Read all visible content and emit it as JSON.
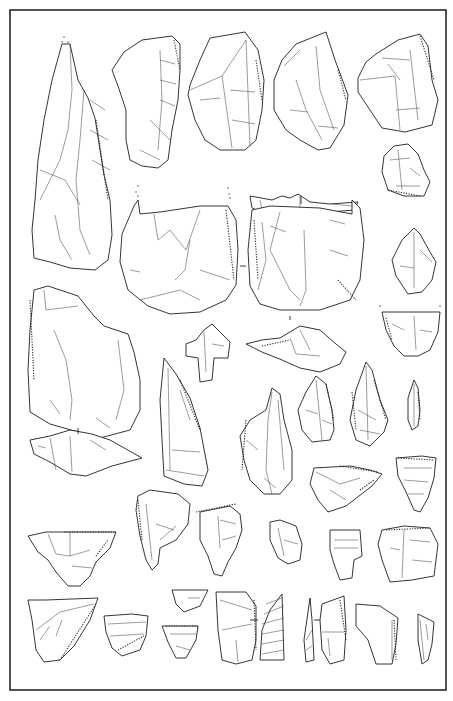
{
  "plate": {
    "width": 453,
    "height": 701,
    "background": "#ffffff",
    "line_color": "#1e1e1e",
    "frame": {
      "x": 10,
      "y": 10,
      "w": 436,
      "h": 680
    }
  },
  "artifacts": [
    {
      "id": "a1",
      "desc": "large pointed blade (tall, left column)",
      "path": "M62,44 L70,44 L78,80 L88,98 L95,118 L100,150 L104,175 L110,200 L112,235 L108,260 L95,270 L70,268 L50,262 L34,258 L32,230 L35,200 L38,160 L44,120 L52,80 Z",
      "scars": [
        "M70,44 L72,90 L68,130 L60,160 L40,200",
        "M84,90 L80,140 L76,180 L80,230 L90,255",
        "M40,170 L65,180 L80,205",
        "M55,215 L60,240 L72,260",
        "M90,100 L105,110",
        "M90,130 L108,140",
        "M92,160 L110,170"
      ],
      "retouch": [
        "M96,120 L102,160 L108,200"
      ]
    },
    {
      "id": "a2",
      "desc": "flake with cortex (top row, 2nd)",
      "path": "M124,52 L142,40 L172,36 L180,44 L180,70 L178,100 L172,130 L168,160 L158,168 L142,166 L130,160 L126,140 L126,110 L118,86 L112,70 Z",
      "scars": [
        "M160,50 L162,100 L158,150",
        "M160,60 L175,64",
        "M160,80 L176,84",
        "M160,100 L175,106",
        "M140,150 L160,160",
        "M150,120 L170,140"
      ],
      "retouch": [
        "M174,40 L180,70"
      ]
    },
    {
      "id": "a3",
      "desc": "trapezoidal flake (top row, 3rd)",
      "path": "M210,38 L245,32 L258,50 L264,80 L262,110 L256,140 L245,150 L220,150 L205,140 L195,120 L188,95 L190,85 L200,60 Z",
      "scars": [
        "M190,90 L222,76 L246,40",
        "M222,76 L232,148",
        "M246,40 L250,146",
        "M200,100 L220,98",
        "M230,90 L255,92",
        "M232,120 L255,124"
      ],
      "retouch": [
        "M256,60 L262,100"
      ]
    },
    {
      "id": "a4",
      "desc": "irregular flake (top row, 4th)",
      "path": "M296,44 L326,32 L335,60 L348,95 L344,125 L330,148 L318,150 L300,140 L286,130 L274,110 L274,80 L282,60 Z",
      "scars": [
        "M284,66 L300,50",
        "M296,80 L306,110 L322,140",
        "M316,46 L320,90 L334,130",
        "M290,110 L308,112",
        "M318,126 L338,128"
      ],
      "retouch": [
        "M338,70 L346,100"
      ]
    },
    {
      "id": "a5",
      "desc": "flake (top row, 5th)",
      "path": "M376,54 L398,40 L420,34 L428,46 L432,80 L438,100 L432,125 L405,132 L382,128 L370,110 L358,92 L358,78 L366,62 Z",
      "scars": [
        "M360,80 L395,76 L400,130",
        "M382,58 L410,60",
        "M410,50 L418,120",
        "M396,110 L420,108",
        "M388,64 L400,80"
      ],
      "retouch": [
        "M420,36 L434,80"
      ]
    },
    {
      "id": "a6",
      "desc": "small end-scraper (right column)",
      "path": "M394,146 L408,144 L418,154 L424,170 L430,182 L424,196 L404,196 L388,190 L382,172 L384,156 Z",
      "scars": [
        "M390,160 L410,158",
        "M398,150 L402,190",
        "M410,168 L420,176",
        "M396,186 L420,186"
      ],
      "retouch": [
        "M388,190 L420,196"
      ]
    },
    {
      "id": "a7",
      "desc": "longitudinal profile view (centre)",
      "path": "M250,196 L272,200 L282,196 L290,198 L298,194 L310,202 L330,204 L358,202 L354,210 L330,212 L300,214 L282,218 L266,214 L252,208 Z",
      "scars": [
        "M260,200 L262,210",
        "M300,196 L300,212",
        "M332,204 L352,206"
      ],
      "retouch": []
    },
    {
      "id": "a8",
      "desc": "large scraper, dorsal face",
      "path": "M134,206 L138,200 L140,214 L160,212 L200,206 L228,206 L236,220 L238,250 L236,285 L226,300 L200,312 L170,314 L148,306 L128,290 L120,262 L122,234 Z",
      "scars": [
        "M154,214 L158,240 L170,230 L186,250 L200,210",
        "M190,240 L185,270 L175,280",
        "M140,300 L180,290 L200,300",
        "M200,270 L230,280",
        "M130,270 L140,272"
      ],
      "retouch": [
        "M226,210 L234,280"
      ]
    },
    {
      "id": "a9",
      "desc": "large scraper, ventral face",
      "path": "M252,210 L270,206 L320,208 L352,214 L352,200 L360,208 L364,240 L360,280 L350,300 L320,310 L280,310 L260,304 L250,286 L248,250 Z",
      "scars": [
        "M262,222 L266,260 L258,290",
        "M280,212 L270,250 L290,290 L300,300",
        "M304,230 L306,290 L300,306",
        "M330,220 L345,224",
        "M330,250 L348,256",
        "M270,226 L286,232"
      ],
      "retouch": [
        "M254,220 L258,280",
        "M338,280 L356,300"
      ]
    },
    {
      "id": "a10",
      "desc": "pointed flake (right column)",
      "path": "M414,228 L420,234 L430,252 L436,262 L432,280 L422,292 L408,294 L396,276 L392,260 L402,240 Z",
      "scars": [
        "M414,232 L414,288",
        "M400,266 L414,268",
        "M420,250 L432,262"
      ],
      "retouch": []
    },
    {
      "id": "a11",
      "desc": "truncated flake fragment",
      "path": "M382,312 L440,312 L438,332 L430,350 L418,356 L404,356 L394,346 L386,330 Z",
      "scars": [
        "M414,316 L416,350",
        "M392,324 L404,330",
        "M420,330 L432,332"
      ],
      "retouch": [
        "M386,318 L392,340"
      ]
    },
    {
      "id": "a12",
      "desc": "notched flake (left, mid)",
      "path": "M34,290 L48,286 L78,296 L94,316 L104,326 L128,334 L134,352 L140,380 L140,410 L130,430 L100,438 L78,432 L50,424 L30,412 L28,370 L30,330 Z",
      "scars": [
        "M44,290 L46,310 L78,306",
        "M54,330 L66,360 L72,400 L70,420",
        "M118,340 L124,390 L116,420",
        "M50,400 L60,414",
        "M96,418 L110,428"
      ],
      "retouch": [
        "M30,300 L34,380"
      ]
    },
    {
      "id": "a13",
      "desc": "small bent flake fragment",
      "path": "M204,330 L212,324 L230,342 L228,358 L214,358 L212,380 L200,382 L198,358 L186,356 L186,344 L196,340 Z",
      "scars": [
        "M204,332 L206,372",
        "M212,344 L224,346"
      ],
      "retouch": []
    },
    {
      "id": "a14",
      "desc": "bilateral crested profile",
      "path": "M246,344 L262,340 L280,338 L300,326 L320,330 L336,344 L346,352 L340,364 L320,372 L300,368 L282,360 L262,352 Z",
      "scars": [
        "M290,338 L296,354 L320,356",
        "M300,330 L310,350"
      ],
      "retouch": [
        "M262,346 L290,340"
      ]
    },
    {
      "id": "a15",
      "desc": "profile view, bifacial (left)",
      "path": "M30,440 L50,436 L70,430 L92,434 L110,440 L142,458 L112,466 L86,476 L70,474 L50,462 L34,454 Z",
      "scars": [
        "M50,438 L56,470",
        "M70,436 L72,472",
        "M90,440 L106,450",
        "M38,446 L46,448"
      ],
      "retouch": []
    },
    {
      "id": "a16",
      "desc": "elongated blade with cortical base",
      "path": "M164,358 L176,374 L190,398 L200,428 L208,470 L202,486 L184,484 L164,476 L162,440 L160,400 Z",
      "scars": [
        "M168,368 L170,470",
        "M180,390 L190,420",
        "M172,450 L200,452",
        "M166,470 L204,476"
      ],
      "retouch": [
        "M180,380 L200,430"
      ]
    },
    {
      "id": "a17",
      "desc": "pointed blade (centre)",
      "path": "M272,388 L280,394 L284,420 L292,450 L292,480 L280,494 L264,494 L250,480 L244,460 L240,436 L250,420 L266,410 Z",
      "scars": [
        "M272,392 L268,420 L266,470 L272,494",
        "M278,400 L284,470",
        "M246,440 L258,450",
        "M264,478 L276,488"
      ],
      "retouch": [
        "M246,420 L242,470"
      ]
    },
    {
      "id": "a18",
      "desc": "triangular point",
      "path": "M316,376 L326,384 L332,410 L334,430 L330,440 L312,442 L302,430 L298,410 L306,392 Z",
      "scars": [
        "M316,380 L322,440",
        "M306,410 L318,414",
        "M322,420 L332,424"
      ],
      "retouch": [
        "M326,384 L334,420"
      ]
    },
    {
      "id": "a19",
      "desc": "elongated retouched point",
      "path": "M366,362 L372,370 L380,400 L388,420 L384,432 L370,446 L356,440 L350,420 L356,390 Z",
      "scars": [
        "M366,366 L368,440",
        "M358,410 L376,420",
        "M360,430 L380,434"
      ],
      "retouch": [
        "M352,392 L356,430",
        "M374,380 L386,420"
      ]
    },
    {
      "id": "a20",
      "desc": "small pointed bladelet",
      "path": "M414,380 L418,388 L420,410 L418,426 L412,430 L408,420 L408,398 Z",
      "scars": [
        "M414,384 L414,426"
      ],
      "retouch": [
        "M418,392 L420,420"
      ]
    },
    {
      "id": "a21",
      "desc": "triangular flake with retouched edge",
      "path": "M314,468 L350,466 L370,470 L382,474 L372,486 L346,506 L328,512 L318,500 L310,484 Z",
      "scars": [
        "M316,472 L340,484 L360,478",
        "M330,490 L346,500"
      ],
      "retouch": [
        "M340,466 L378,472",
        "M360,490 L374,480"
      ]
    },
    {
      "id": "a22",
      "desc": "splayed end flake",
      "path": "M396,458 L422,456 L436,458 L434,478 L428,498 L420,512 L414,510 L406,492 L398,476 Z",
      "scars": [
        "M404,468 L432,468",
        "M404,480 L428,482",
        "M408,494 L424,494"
      ],
      "retouch": [
        "M398,458 L434,460"
      ]
    },
    {
      "id": "a23",
      "desc": "thick flake fragment",
      "path": "M138,496 L150,490 L178,494 L190,504 L188,524 L176,540 L160,548 L158,564 L152,570 L146,560 L140,536 L136,510 Z",
      "scars": [
        "M146,504 L152,560",
        "M156,524 L174,530",
        "M160,540 L176,526"
      ],
      "retouch": [
        "M138,500 L142,540"
      ]
    },
    {
      "id": "a24",
      "desc": "scraper with denticulate edge (left)",
      "path": "M28,536 L46,532 L68,532 L116,532 L110,548 L96,562 L90,576 L80,586 L68,586 L56,572 L48,560 L38,552 Z",
      "scars": [
        "M48,534 L56,554 L70,556 L90,550",
        "M70,532 L70,556",
        "M72,566 L92,568"
      ],
      "retouch": [
        "M64,532 L116,532",
        "M96,556 L108,540"
      ]
    },
    {
      "id": "a25",
      "desc": "hooked flake",
      "path": "M200,512 L230,506 L240,514 L242,530 L236,548 L228,562 L222,576 L214,574 L208,556 L200,540 Z",
      "scars": [
        "M218,516 L220,548",
        "M220,520 L236,524",
        "M222,540 L236,536"
      ],
      "retouch": [
        "M196,512 L236,504"
      ]
    },
    {
      "id": "a26",
      "desc": "small irregular flake",
      "path": "M270,522 L280,520 L296,526 L302,544 L300,560 L288,564 L278,558 L270,540 Z",
      "scars": [
        "M278,528 L284,556",
        "M284,540 L298,544"
      ],
      "retouch": []
    },
    {
      "id": "a27",
      "desc": "rectangular flake with notch",
      "path": "M330,530 L360,530 L362,556 L354,560 L352,578 L340,580 L334,564 L330,550 Z",
      "scars": [
        "M334,540 L358,540",
        "M334,548 L358,548"
      ],
      "retouch": []
    },
    {
      "id": "a28",
      "desc": "squat flake",
      "path": "M382,530 L404,526 L430,528 L438,544 L434,576 L412,580 L390,582 L382,560 L378,544 Z",
      "scars": [
        "M404,530 L402,578",
        "M410,540 L430,542",
        "M390,548 L400,550",
        "M412,560 L432,562"
      ],
      "retouch": [
        "M386,530 L430,528"
      ]
    },
    {
      "id": "a29",
      "desc": "large triangular flake (bottom left)",
      "path": "M28,600 L46,600 L98,598 L90,620 L74,646 L60,660 L44,662 L36,650 L32,620 Z",
      "scars": [
        "M36,630 L60,612 L94,604",
        "M40,640 L50,626",
        "M56,636 L62,620"
      ],
      "retouch": [
        "M60,660 L96,604"
      ]
    },
    {
      "id": "a30",
      "desc": "small truncated flake",
      "path": "M104,616 L132,614 L148,616 L146,636 L140,650 L122,656 L112,648 L106,632 Z",
      "scars": [
        "M108,624 L146,622",
        "M110,636 L144,634"
      ],
      "retouch": [
        "M118,650 L144,636"
      ]
    },
    {
      "id": "a31",
      "desc": "small triangular fragment (upper)",
      "path": "M172,590 L208,590 L200,606 L184,612 L176,604 Z",
      "scars": [
        "M188,598 L200,598"
      ],
      "retouch": []
    },
    {
      "id": "a32",
      "desc": "small triangular fragment (lower)",
      "path": "M162,626 L198,626 L196,640 L186,658 L176,658 L168,642 Z",
      "scars": [
        "M170,634 L196,634",
        "M176,646 L190,650"
      ],
      "retouch": [
        "M166,626 L198,626"
      ]
    },
    {
      "id": "a33",
      "desc": "elongated blade fragment",
      "path": "M216,592 L246,592 L256,606 L256,640 L252,660 L236,664 L222,660 L218,630 Z",
      "scars": [
        "M220,600 L252,610",
        "M222,630 L252,624",
        "M236,640 L238,662"
      ],
      "retouch": [
        "M254,600 L256,650"
      ]
    },
    {
      "id": "a34",
      "desc": "profile section hatched",
      "path": "M282,594 L284,660 L260,660 L262,630 L270,610 Z",
      "scars": [
        "M266,604 L282,598",
        "M264,614 L284,606",
        "M262,624 L284,618",
        "M262,634 L284,630",
        "M262,644 L284,640",
        "M262,654 L284,650"
      ],
      "retouch": []
    },
    {
      "id": "a35",
      "desc": "narrow profile sliver",
      "path": "M310,598 L312,620 L314,660 L306,662 L304,640 Z",
      "scars": [
        "M306,640 L312,630",
        "M306,650 L312,646"
      ],
      "retouch": []
    },
    {
      "id": "a36",
      "desc": "rectangular blade segment",
      "path": "M322,604 L344,596 L346,630 L344,660 L330,664 L322,650 L320,620 Z",
      "scars": [
        "M322,632 L344,632",
        "M328,638 L330,656"
      ],
      "retouch": [
        "M340,600 L346,640"
      ]
    },
    {
      "id": "a37",
      "desc": "broad flake segment (bottom)",
      "path": "M356,604 L380,606 L398,618 L396,644 L392,664 L376,664 L368,640 L356,626 Z",
      "scars": [
        "M392,620 L392,660"
      ],
      "retouch": [
        "M394,620 L396,660"
      ]
    },
    {
      "id": "a38",
      "desc": "narrow burin fragment (bottom right)",
      "path": "M418,614 L434,622 L432,644 L428,660 L422,664 L418,640 Z",
      "scars": [
        "M420,620 L424,660",
        "M426,624 L428,640"
      ],
      "retouch": []
    }
  ],
  "section_marks": [
    {
      "x1": 301,
      "y1": 196,
      "x2": 301,
      "y2": 204
    },
    {
      "x1": 240,
      "y1": 266,
      "x2": 246,
      "y2": 266
    },
    {
      "x1": 290,
      "y1": 316,
      "x2": 290,
      "y2": 320
    },
    {
      "x1": 78,
      "y1": 428,
      "x2": 78,
      "y2": 434
    },
    {
      "x1": 250,
      "y1": 620,
      "x2": 258,
      "y2": 620
    },
    {
      "x1": 314,
      "y1": 620,
      "x2": 320,
      "y2": 620
    }
  ],
  "dots": [
    {
      "x": 64,
      "y": 37
    },
    {
      "x": 68,
      "y": 42
    },
    {
      "x": 62,
      "y": 42
    },
    {
      "x": 138,
      "y": 186
    },
    {
      "x": 136,
      "y": 192
    },
    {
      "x": 138,
      "y": 196
    },
    {
      "x": 228,
      "y": 188
    },
    {
      "x": 229,
      "y": 194
    },
    {
      "x": 230,
      "y": 198
    },
    {
      "x": 380,
      "y": 306
    },
    {
      "x": 440,
      "y": 306
    }
  ]
}
